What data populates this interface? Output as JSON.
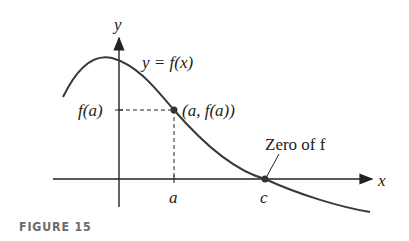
{
  "figure": {
    "caption": "FIGURE 15",
    "axis_x_label": "x",
    "axis_y_label": "y",
    "curve_label": "y = f(x)",
    "point_label": "(a, f(a))",
    "y_tick_label": "f(a)",
    "x_tick_a": "a",
    "x_tick_c": "c",
    "annotation": "Zero of f",
    "colors": {
      "curve": "#3a3a3a",
      "axes": "#222222",
      "caption": "#6b6b6b"
    }
  }
}
